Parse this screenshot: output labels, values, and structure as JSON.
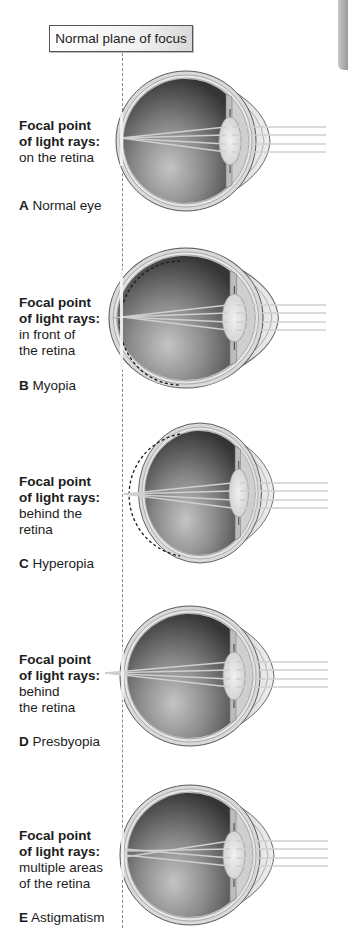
{
  "header": {
    "plane_label": "Normal plane of focus"
  },
  "panels": [
    {
      "id": "A",
      "heading_line1": "Focal point",
      "heading_line2": "of light rays:",
      "detail_line1": "on the retina",
      "detail_line2": "",
      "letter": "A",
      "name": "Normal eye",
      "focus": "on-retina"
    },
    {
      "id": "B",
      "heading_line1": "Focal point",
      "heading_line2": "of light rays:",
      "detail_line1": "in front of",
      "detail_line2": "the retina",
      "letter": "B",
      "name": "Myopia",
      "focus": "in-front"
    },
    {
      "id": "C",
      "heading_line1": "Focal point",
      "heading_line2": "of light rays:",
      "detail_line1": "behind the",
      "detail_line2": "retina",
      "letter": "C",
      "name": "Hyperopia",
      "focus": "behind"
    },
    {
      "id": "D",
      "heading_line1": "Focal point",
      "heading_line2": "of light rays:",
      "detail_line1": "behind",
      "detail_line2": "the retina",
      "letter": "D",
      "name": "Presbyopia",
      "focus": "behind"
    },
    {
      "id": "E",
      "heading_line1": "Focal point",
      "heading_line2": "of light rays:",
      "detail_line1": "multiple areas",
      "detail_line2": "of the retina",
      "letter": "E",
      "name": "Astigmatism",
      "focus": "multiple"
    }
  ],
  "colors": {
    "sclera": "#d6d6d6",
    "eye_interior_dark": "#3d3d3d",
    "eye_interior_light": "#bdbdbd",
    "ray": "#c9c9c9",
    "dashed_line": "#8a8a8a"
  }
}
